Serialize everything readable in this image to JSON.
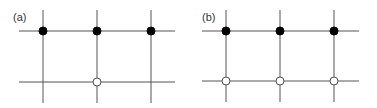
{
  "panels": [
    {
      "label": "(a)",
      "label_pos": [
        13,
        21
      ],
      "vertical_lines_x": [
        43,
        97,
        151
      ],
      "vertical_span": [
        10,
        103
      ],
      "horizontal_lines_y": [
        31,
        82
      ],
      "horizontal_span": [
        19,
        175
      ],
      "nodes": [
        {
          "x": 43,
          "y": 31,
          "type": "filled"
        },
        {
          "x": 97,
          "y": 31,
          "type": "filled"
        },
        {
          "x": 151,
          "y": 31,
          "type": "filled"
        },
        {
          "x": 97,
          "y": 82,
          "type": "open"
        }
      ]
    },
    {
      "label": "(b)",
      "label_pos": [
        202,
        21
      ],
      "vertical_lines_x": [
        226,
        280,
        334
      ],
      "vertical_span": [
        10,
        102
      ],
      "horizontal_lines_y": [
        31,
        81
      ],
      "horizontal_span": [
        202,
        359
      ],
      "nodes": [
        {
          "x": 226,
          "y": 31,
          "type": "filled"
        },
        {
          "x": 280,
          "y": 31,
          "type": "filled"
        },
        {
          "x": 334,
          "y": 31,
          "type": "filled"
        },
        {
          "x": 226,
          "y": 81,
          "type": "open"
        },
        {
          "x": 280,
          "y": 81,
          "type": "open"
        },
        {
          "x": 334,
          "y": 81,
          "type": "open"
        }
      ]
    }
  ],
  "node_radius": 4,
  "colors": {
    "line": "#555555",
    "filled": "#000000",
    "open_fill": "#ffffff",
    "label": "#333333"
  }
}
